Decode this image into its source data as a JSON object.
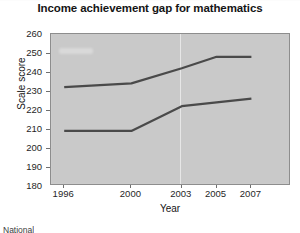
{
  "chart_data": {
    "type": "line",
    "title": "Income achievement gap for mathematics",
    "xlabel": "Year",
    "ylabel": "Scale score",
    "x": [
      1996,
      2000,
      2003,
      2005,
      2007
    ],
    "xtick_labels": [
      "1996",
      "2000",
      "2003",
      "2005",
      "2007"
    ],
    "ylim": [
      180,
      260
    ],
    "ytick_labels": [
      "260",
      "250",
      "240",
      "230",
      "220",
      "210",
      "200",
      "190",
      "180"
    ],
    "ytick_values": [
      260,
      250,
      240,
      230,
      220,
      210,
      200,
      190,
      180
    ],
    "grid": false,
    "legend_position": "none",
    "series": [
      {
        "name": "Higher income",
        "values": [
          232,
          234,
          242,
          248,
          248
        ],
        "color": "#4a4a4a"
      },
      {
        "name": "Lower income",
        "values": [
          209,
          209,
          222,
          224,
          226
        ],
        "color": "#4a4a4a"
      }
    ],
    "plot_background": "#c9c9c9",
    "line_color": "#4a4a4a"
  },
  "footnote": {
    "text": "National"
  }
}
